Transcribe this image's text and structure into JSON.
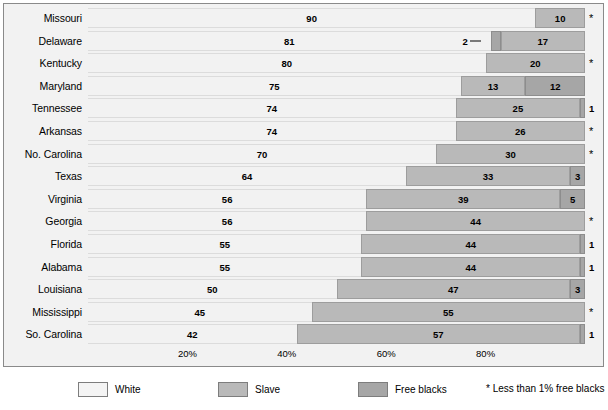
{
  "chart_data": {
    "type": "bar",
    "subtype": "horizontal-stacked-percentage",
    "title": "",
    "xlabel": "",
    "ylabel": "",
    "xlim": [
      0,
      100
    ],
    "grid": false,
    "legend_position": "bottom",
    "categories": [
      "Missouri",
      "Delaware",
      "Kentucky",
      "Maryland",
      "Tennessee",
      "Arkansas",
      "No. Carolina",
      "Texas",
      "Virginia",
      "Georgia",
      "Florida",
      "Alabama",
      "Louisiana",
      "Mississippi",
      "So. Carolina"
    ],
    "series": [
      {
        "name": "White",
        "values": [
          90,
          81,
          80,
          75,
          74,
          74,
          70,
          64,
          56,
          56,
          55,
          55,
          50,
          45,
          42
        ]
      },
      {
        "name": "Slave",
        "values": [
          10,
          17,
          20,
          13,
          25,
          26,
          30,
          33,
          39,
          44,
          44,
          44,
          47,
          55,
          57
        ]
      },
      {
        "name": "Free blacks",
        "values": [
          0,
          2,
          0,
          12,
          1,
          0,
          0,
          3,
          5,
          0,
          1,
          1,
          3,
          0,
          1
        ]
      }
    ],
    "xticks": [
      20,
      40,
      60,
      80
    ],
    "xticklabels": [
      "20%",
      "40%",
      "60%",
      "80%"
    ],
    "legend": [
      {
        "label": "White",
        "color": "#f4f4f4"
      },
      {
        "label": "Slave",
        "color": "#b9b9b9"
      },
      {
        "label": "Free blacks",
        "color": "#a6a6a6"
      }
    ],
    "footnote": "* Less than 1% free blacks",
    "footnote_symbol": "*",
    "rows": [
      {
        "label": "Missouri",
        "segments": [
          {
            "series": "White",
            "value": 90,
            "display": "90"
          },
          {
            "series": "Slave",
            "value": 10,
            "display": "10"
          }
        ],
        "marker": "*",
        "marker_type": "star",
        "callout": null
      },
      {
        "label": "Delaware",
        "segments": [
          {
            "series": "White",
            "value": 81,
            "display": "81"
          },
          {
            "series": "Free blacks",
            "value": 2,
            "display": ""
          },
          {
            "series": "Slave",
            "value": 17,
            "display": "17"
          }
        ],
        "marker": "",
        "marker_type": "none",
        "callout": {
          "text": "2",
          "value": 2
        }
      },
      {
        "label": "Kentucky",
        "segments": [
          {
            "series": "White",
            "value": 80,
            "display": "80"
          },
          {
            "series": "Slave",
            "value": 20,
            "display": "20"
          }
        ],
        "marker": "*",
        "marker_type": "star",
        "callout": null
      },
      {
        "label": "Maryland",
        "segments": [
          {
            "series": "White",
            "value": 75,
            "display": "75"
          },
          {
            "series": "Slave",
            "value": 13,
            "display": "13"
          },
          {
            "series": "Free blacks",
            "value": 12,
            "display": "12"
          }
        ],
        "marker": "",
        "marker_type": "none",
        "callout": null
      },
      {
        "label": "Tennessee",
        "segments": [
          {
            "series": "White",
            "value": 74,
            "display": "74"
          },
          {
            "series": "Slave",
            "value": 25,
            "display": "25"
          },
          {
            "series": "Free blacks",
            "value": 1,
            "display": ""
          }
        ],
        "marker": "1",
        "marker_type": "number",
        "callout": null
      },
      {
        "label": "Arkansas",
        "segments": [
          {
            "series": "White",
            "value": 74,
            "display": "74"
          },
          {
            "series": "Slave",
            "value": 26,
            "display": "26"
          }
        ],
        "marker": "*",
        "marker_type": "star",
        "callout": null
      },
      {
        "label": "No. Carolina",
        "segments": [
          {
            "series": "White",
            "value": 70,
            "display": "70"
          },
          {
            "series": "Slave",
            "value": 30,
            "display": "30"
          }
        ],
        "marker": "*",
        "marker_type": "star",
        "callout": null
      },
      {
        "label": "Texas",
        "segments": [
          {
            "series": "White",
            "value": 64,
            "display": "64"
          },
          {
            "series": "Slave",
            "value": 33,
            "display": "33"
          },
          {
            "series": "Free blacks",
            "value": 3,
            "display": "3"
          }
        ],
        "marker": "",
        "marker_type": "none",
        "callout": null
      },
      {
        "label": "Virginia",
        "segments": [
          {
            "series": "White",
            "value": 56,
            "display": "56"
          },
          {
            "series": "Slave",
            "value": 39,
            "display": "39"
          },
          {
            "series": "Free blacks",
            "value": 5,
            "display": "5"
          }
        ],
        "marker": "",
        "marker_type": "none",
        "callout": null
      },
      {
        "label": "Georgia",
        "segments": [
          {
            "series": "White",
            "value": 56,
            "display": "56"
          },
          {
            "series": "Slave",
            "value": 44,
            "display": "44"
          }
        ],
        "marker": "*",
        "marker_type": "star",
        "callout": null
      },
      {
        "label": "Florida",
        "segments": [
          {
            "series": "White",
            "value": 55,
            "display": "55"
          },
          {
            "series": "Slave",
            "value": 44,
            "display": "44"
          },
          {
            "series": "Free blacks",
            "value": 1,
            "display": ""
          }
        ],
        "marker": "1",
        "marker_type": "number",
        "callout": null
      },
      {
        "label": "Alabama",
        "segments": [
          {
            "series": "White",
            "value": 55,
            "display": "55"
          },
          {
            "series": "Slave",
            "value": 44,
            "display": "44"
          },
          {
            "series": "Free blacks",
            "value": 1,
            "display": ""
          }
        ],
        "marker": "1",
        "marker_type": "number",
        "callout": null
      },
      {
        "label": "Louisiana",
        "segments": [
          {
            "series": "White",
            "value": 50,
            "display": "50"
          },
          {
            "series": "Slave",
            "value": 47,
            "display": "47"
          },
          {
            "series": "Free blacks",
            "value": 3,
            "display": "3"
          }
        ],
        "marker": "",
        "marker_type": "none",
        "callout": null
      },
      {
        "label": "Mississippi",
        "segments": [
          {
            "series": "White",
            "value": 45,
            "display": "45"
          },
          {
            "series": "Slave",
            "value": 55,
            "display": "55"
          }
        ],
        "marker": "*",
        "marker_type": "star",
        "callout": null
      },
      {
        "label": "So. Carolina",
        "segments": [
          {
            "series": "White",
            "value": 42,
            "display": "42"
          },
          {
            "series": "Slave",
            "value": 57,
            "display": "57"
          },
          {
            "series": "Free blacks",
            "value": 1,
            "display": ""
          }
        ],
        "marker": "1",
        "marker_type": "number",
        "callout": null
      }
    ]
  }
}
